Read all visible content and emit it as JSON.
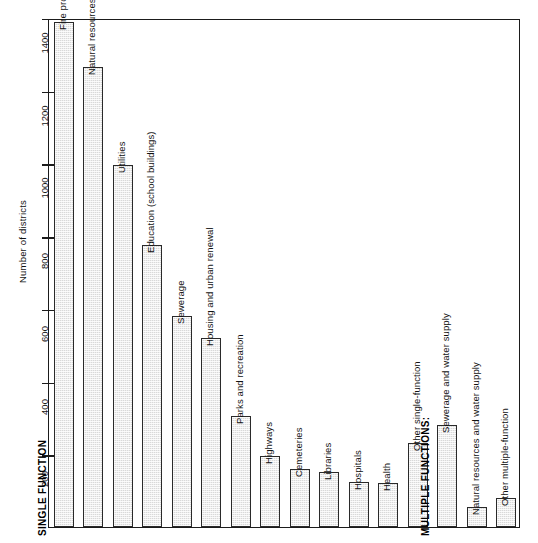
{
  "chart_data": {
    "type": "bar",
    "title": "",
    "xlabel": "",
    "ylabel": "Number of districts",
    "ylim": [
      0,
      1400
    ],
    "yticks": [
      200,
      400,
      600,
      800,
      1000,
      1200,
      1400
    ],
    "ytick_labels": [
      "200",
      "400",
      "600",
      "800",
      "1000",
      "1200",
      "1400"
    ],
    "grid": false,
    "legend": "none",
    "group_labels": [
      "SINGLE FUNCTION",
      "MULTIPLE FUNCTIONS:"
    ],
    "categories": [
      "Fire protection",
      "Natural resources",
      "Utilities",
      "Education (school buildings)",
      "Sewerage",
      "Housing and urban renewal",
      "Parks and recreation",
      "Highways",
      "Cemeteries",
      "Libraries",
      "Hospitals",
      "Health",
      "Other single-function",
      "Sewerage and water supply",
      "Natural resources and water supply",
      "Other multiple-function"
    ],
    "values": [
      1390,
      1265,
      995,
      775,
      580,
      520,
      305,
      195,
      160,
      150,
      125,
      120,
      230,
      280,
      55,
      80
    ],
    "bars": [
      {
        "label": "Fire protection",
        "value": 1390,
        "group": "single"
      },
      {
        "label": "Natural resources",
        "value": 1265,
        "group": "single"
      },
      {
        "label": "Utilities",
        "value": 995,
        "group": "single"
      },
      {
        "label": "Education (school buildings)",
        "value": 775,
        "group": "single"
      },
      {
        "label": "Sewerage",
        "value": 580,
        "group": "single"
      },
      {
        "label": "Housing and urban renewal",
        "value": 520,
        "group": "single"
      },
      {
        "label": "Parks and recreation",
        "value": 305,
        "group": "single"
      },
      {
        "label": "Highways",
        "value": 195,
        "group": "single"
      },
      {
        "label": "Cemeteries",
        "value": 160,
        "group": "single"
      },
      {
        "label": "Libraries",
        "value": 150,
        "group": "single"
      },
      {
        "label": "Hospitals",
        "value": 125,
        "group": "single"
      },
      {
        "label": "Health",
        "value": 120,
        "group": "single"
      },
      {
        "label": "Other single-function",
        "value": 230,
        "group": "single"
      },
      {
        "label": "Sewerage and water supply",
        "value": 280,
        "group": "multiple"
      },
      {
        "label": "Natural resources and water supply",
        "value": 55,
        "group": "multiple"
      },
      {
        "label": "Other multiple-function",
        "value": 80,
        "group": "multiple"
      }
    ],
    "colors": {
      "bar_fill": "#d9d9d9",
      "bar_border": "#2a2a2a",
      "axis": "#1b1b1b",
      "background": "#ffffff"
    }
  }
}
